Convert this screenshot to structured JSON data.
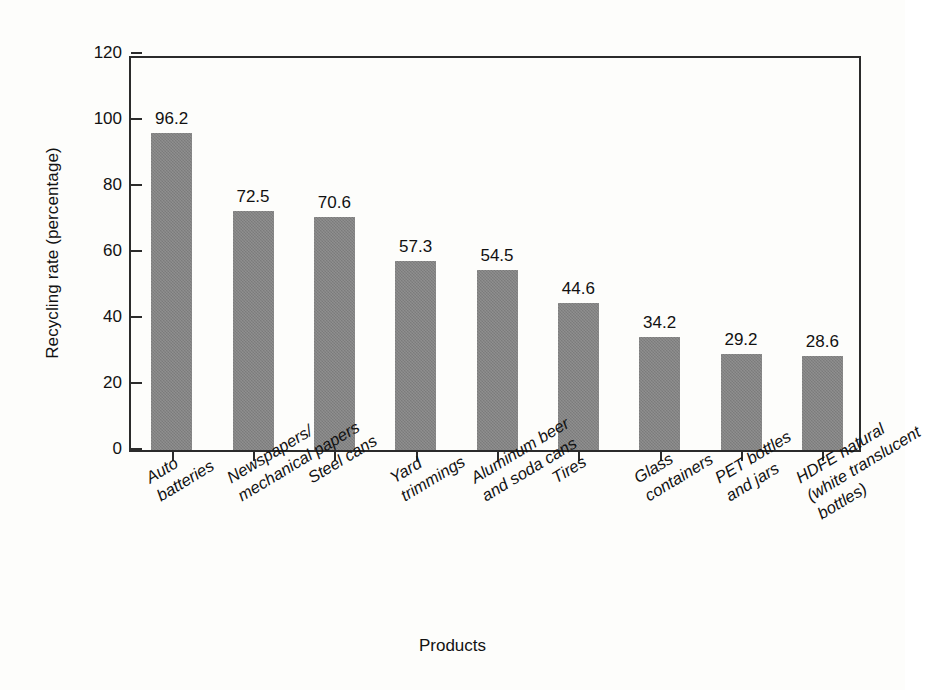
{
  "chart_data": {
    "type": "bar",
    "title": "",
    "subtitle": "",
    "xlabel": "Products",
    "ylabel": "Recycling rate (percentage)",
    "categories": [
      "Auto batteries",
      "Newspapers/ mechanical papers",
      "Steel cans",
      "Yard trimmings",
      "Aluminum beer and soda cans",
      "Tires",
      "Glass containers",
      "PET bottles and jars",
      "HDFE natural (white translucent bottles)"
    ],
    "category_lines": [
      [
        "Auto",
        "batteries"
      ],
      [
        "Newspapers/",
        "mechanical papers"
      ],
      [
        "Steel cans"
      ],
      [
        "Yard",
        "trimmings"
      ],
      [
        "Aluminum beer",
        "and soda cans"
      ],
      [
        "Tires"
      ],
      [
        "Glass",
        "containers"
      ],
      [
        "PET bottles",
        "and jars"
      ],
      [
        "HDFE natural",
        "(white translucent",
        "bottles)"
      ]
    ],
    "values": [
      96.2,
      72.5,
      70.6,
      57.3,
      54.5,
      44.6,
      34.2,
      29.2,
      28.6
    ],
    "value_labels": [
      "96.2",
      "72.5",
      "70.6",
      "57.3",
      "54.5",
      "44.6",
      "34.2",
      "29.2",
      "28.6"
    ],
    "ylim": [
      0,
      120
    ],
    "yticks": [
      0,
      20,
      40,
      60,
      80,
      100,
      120
    ],
    "ytick_labels": [
      "0",
      "20",
      "40",
      "60",
      "80",
      "100",
      "120"
    ],
    "grid": false,
    "legend": false,
    "legend_position": "none",
    "bar_color": "#828282",
    "axis_color": "#2b2b2b",
    "text_color": "#121212",
    "background_color": "#fdfdfb"
  }
}
